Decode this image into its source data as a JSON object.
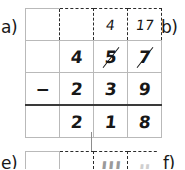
{
  "worksheet": {
    "problem_labels": {
      "a": "a)",
      "b": "b)",
      "e": "e)",
      "f": "f)"
    }
  },
  "problem_a": {
    "operator": "−",
    "borrow_row": {
      "col1": "",
      "col2": "",
      "col3": "4",
      "col4": "17"
    },
    "minuend_row": {
      "col1": "",
      "col2": "4",
      "col3": "5",
      "col4": "7",
      "col3_crossed_out": true,
      "col4_crossed_out": true
    },
    "subtrahend_row": {
      "col1": "−",
      "col2": "2",
      "col3": "3",
      "col4": "9"
    },
    "answer_row": {
      "col1": "",
      "col2": "2",
      "col3": "1",
      "col4": "8"
    }
  },
  "problem_e_partial": {
    "col1": "",
    "col2": "",
    "col3": "Ш",
    "col4": "ᴜ"
  },
  "colors": {
    "ink": "#171717",
    "grid_line": "#b9b9b9",
    "dashed_line": "#2b2b2b",
    "answer_rule": "#3a3a3a",
    "ghost_ink": "#cfcfcf"
  }
}
